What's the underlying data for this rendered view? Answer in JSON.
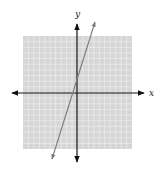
{
  "chart_data": {
    "type": "line",
    "title": "",
    "xlabel": "x",
    "ylabel": "y",
    "xlim": [
      -10,
      10
    ],
    "ylim": [
      -10,
      10
    ],
    "grid": true,
    "grid_step": 1,
    "tick_labels": false,
    "series": [
      {
        "name": "line",
        "equation": "y = 3x + 2",
        "slope": 3,
        "y_intercept": 2,
        "x_intercept": -0.67,
        "points": [
          [
            -4,
            -10
          ],
          [
            -2,
            -4
          ],
          [
            0,
            2
          ],
          [
            2,
            8
          ],
          [
            2.67,
            10
          ]
        ],
        "arrows_both_ends": true,
        "color": "#7a7a7a"
      }
    ]
  },
  "labels": {
    "x_axis": "x",
    "y_axis": "y"
  },
  "colors": {
    "grid_background": "#d6d6d6",
    "grid_lines": "#f2f2f2",
    "axes": "#111111",
    "line": "#7a7a7a"
  },
  "layout": {
    "grid_left": 23,
    "grid_top": 36,
    "grid_right": 132,
    "grid_bottom": 149,
    "origin_x": 77,
    "origin_y": 93
  }
}
